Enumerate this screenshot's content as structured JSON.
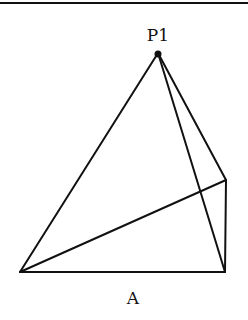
{
  "figure": {
    "labels": {
      "apex": "P1",
      "base": "A"
    },
    "points": {
      "apex": [
        158,
        53
      ],
      "bottom_left": [
        20,
        272
      ],
      "bottom_right": [
        225,
        272
      ],
      "right": [
        226,
        180
      ]
    },
    "stroke_color": "#111111"
  }
}
